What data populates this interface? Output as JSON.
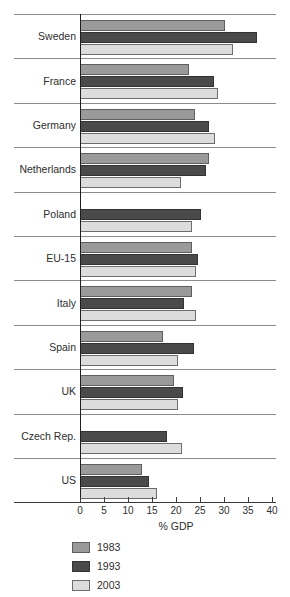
{
  "chart_data": {
    "type": "bar",
    "orientation": "horizontal",
    "title": "",
    "xlabel": "% GDP",
    "ylabel": "",
    "xlim": [
      0,
      40
    ],
    "xticks": [
      0,
      5,
      10,
      15,
      20,
      25,
      30,
      35,
      40
    ],
    "grid": false,
    "legend_position": "bottom-left",
    "categories": [
      "Sweden",
      "France",
      "Germany",
      "Netherlands",
      "Poland",
      "EU-15",
      "Italy",
      "Spain",
      "UK",
      "Czech Rep.",
      "US"
    ],
    "series": [
      {
        "name": "1983",
        "color": "#9a9a9a",
        "values": [
          30.2,
          22.7,
          24.0,
          26.9,
          null,
          23.3,
          23.3,
          17.3,
          19.6,
          null,
          12.9
        ]
      },
      {
        "name": "1993",
        "color": "#4a4a4a",
        "values": [
          36.9,
          27.9,
          26.9,
          26.3,
          25.2,
          24.6,
          21.7,
          23.8,
          21.5,
          18.1,
          14.4
        ]
      },
      {
        "name": "2003",
        "color": "#dcdcdc",
        "values": [
          31.9,
          28.8,
          28.1,
          21.0,
          23.3,
          24.2,
          24.2,
          20.4,
          20.4,
          21.3,
          16.0
        ]
      }
    ]
  },
  "legend": {
    "items": [
      {
        "label": "1983",
        "key": "y1983"
      },
      {
        "label": "1993",
        "key": "y1993"
      },
      {
        "label": "2003",
        "key": "y2003"
      }
    ]
  },
  "axis": {
    "x_title": "% GDP",
    "tick_labels": [
      "0",
      "5",
      "10",
      "15",
      "20",
      "25",
      "30",
      "35",
      "40"
    ]
  }
}
